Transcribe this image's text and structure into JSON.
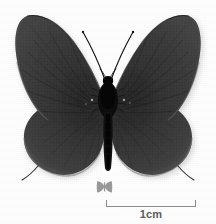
{
  "plate": {
    "background_color": "#ffffff",
    "width": 216,
    "height": 224,
    "subject": "butterfly-specimen",
    "view": "dorsal-spread-mounted",
    "rendering": "grayscale-photograph"
  },
  "specimen": {
    "name": "butterfly-specimen",
    "body_color": "#0d0d0d",
    "wing_color": "#3a3a3a",
    "wing_color_dark": "#2a2a2a",
    "wing_color_light": "#4d4d4d",
    "fringe_color": "#6b6b6b",
    "shadow_color": "#c9c9c9",
    "parts": [
      {
        "name": "left-forewing"
      },
      {
        "name": "right-forewing"
      },
      {
        "name": "left-hindwing"
      },
      {
        "name": "right-hindwing"
      },
      {
        "name": "thorax"
      },
      {
        "name": "abdomen"
      },
      {
        "name": "head"
      },
      {
        "name": "left-antenna"
      },
      {
        "name": "right-antenna"
      },
      {
        "name": "left-hindwing-tail"
      },
      {
        "name": "right-hindwing-tail"
      }
    ]
  },
  "thumb_icon": {
    "name": "butterfly-thumbnail-icon",
    "color": "#9a9a9a"
  },
  "scalebar": {
    "label": "1cm",
    "line_color": "#8d8d8d",
    "text_color": "#5e5e5e",
    "length_px": 90
  }
}
